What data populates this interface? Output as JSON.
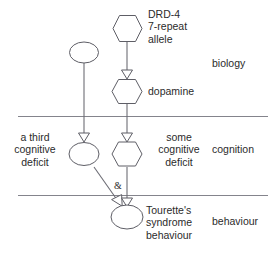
{
  "diagram": {
    "title_absent": true,
    "layers": [
      {
        "id": "biology",
        "label": "biology"
      },
      {
        "id": "cognition",
        "label": "cognition"
      },
      {
        "id": "behaviour",
        "label": "behaviour"
      }
    ],
    "nodes": [
      {
        "id": "drd4",
        "shape": "hexagon",
        "layer": "biology",
        "label": "DRD-4\n7-repeat\nallele",
        "label_position": "right"
      },
      {
        "id": "unlabelled-biology",
        "shape": "ellipse",
        "layer": "biology",
        "label": "",
        "label_position": "none"
      },
      {
        "id": "dopamine",
        "shape": "hexagon",
        "layer": "biology",
        "label": "dopamine",
        "label_position": "right"
      },
      {
        "id": "third-cognitive-deficit",
        "shape": "ellipse",
        "layer": "cognition",
        "label": "a third\ncognitive\ndeficit",
        "label_position": "left"
      },
      {
        "id": "some-cognitive-deficit",
        "shape": "hexagon",
        "layer": "cognition",
        "label": "some\ncognitive\ndeficit",
        "label_position": "right"
      },
      {
        "id": "tourettes-syndrome-behaviour",
        "shape": "ellipse",
        "layer": "behaviour",
        "label": "Tourette's\nsyndrome\nbehaviour",
        "label_position": "right"
      }
    ],
    "edges": [
      {
        "from": "drd4",
        "to": "dopamine",
        "style": "straight",
        "arrow": "hollow-triangle"
      },
      {
        "from": "unlabelled-biology",
        "to": "third-cognitive-deficit",
        "style": "straight",
        "arrow": "hollow-triangle"
      },
      {
        "from": "dopamine",
        "to": "some-cognitive-deficit",
        "style": "straight",
        "arrow": "hollow-triangle"
      },
      {
        "from": "third-cognitive-deficit",
        "to": "tourettes-syndrome-behaviour",
        "style": "diagonal",
        "arrow": "hollow-triangle"
      },
      {
        "from": "some-cognitive-deficit",
        "to": "tourettes-syndrome-behaviour",
        "style": "straight",
        "arrow": "hollow-triangle"
      }
    ],
    "junction": {
      "symbol": "&",
      "meaning": "logical-and"
    },
    "colors": {
      "stroke": "#5e5e66",
      "line": "#6d6d75",
      "divider": "#84848c",
      "text": "#2b2b2b",
      "background": "#ffffff"
    }
  }
}
